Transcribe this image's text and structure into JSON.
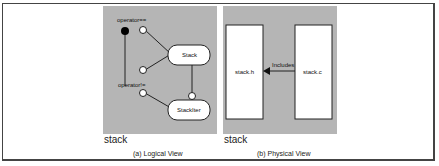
{
  "logical_view": {
    "caption": "(a) Logical View",
    "package_name": "stack",
    "classes": [
      {
        "name": "Stack"
      },
      {
        "name": "StackIter"
      }
    ],
    "operations": [
      {
        "label": "operator=="
      },
      {
        "label": "operator!="
      }
    ]
  },
  "physical_view": {
    "caption": "(b) Physical View",
    "package_name": "stack",
    "files": [
      {
        "name": "stack.h"
      },
      {
        "name": "stack.c"
      }
    ],
    "dependency_label": "Includes"
  },
  "colors": {
    "panel": "#b5b5b5",
    "line": "#222222",
    "frame": "#444444"
  }
}
